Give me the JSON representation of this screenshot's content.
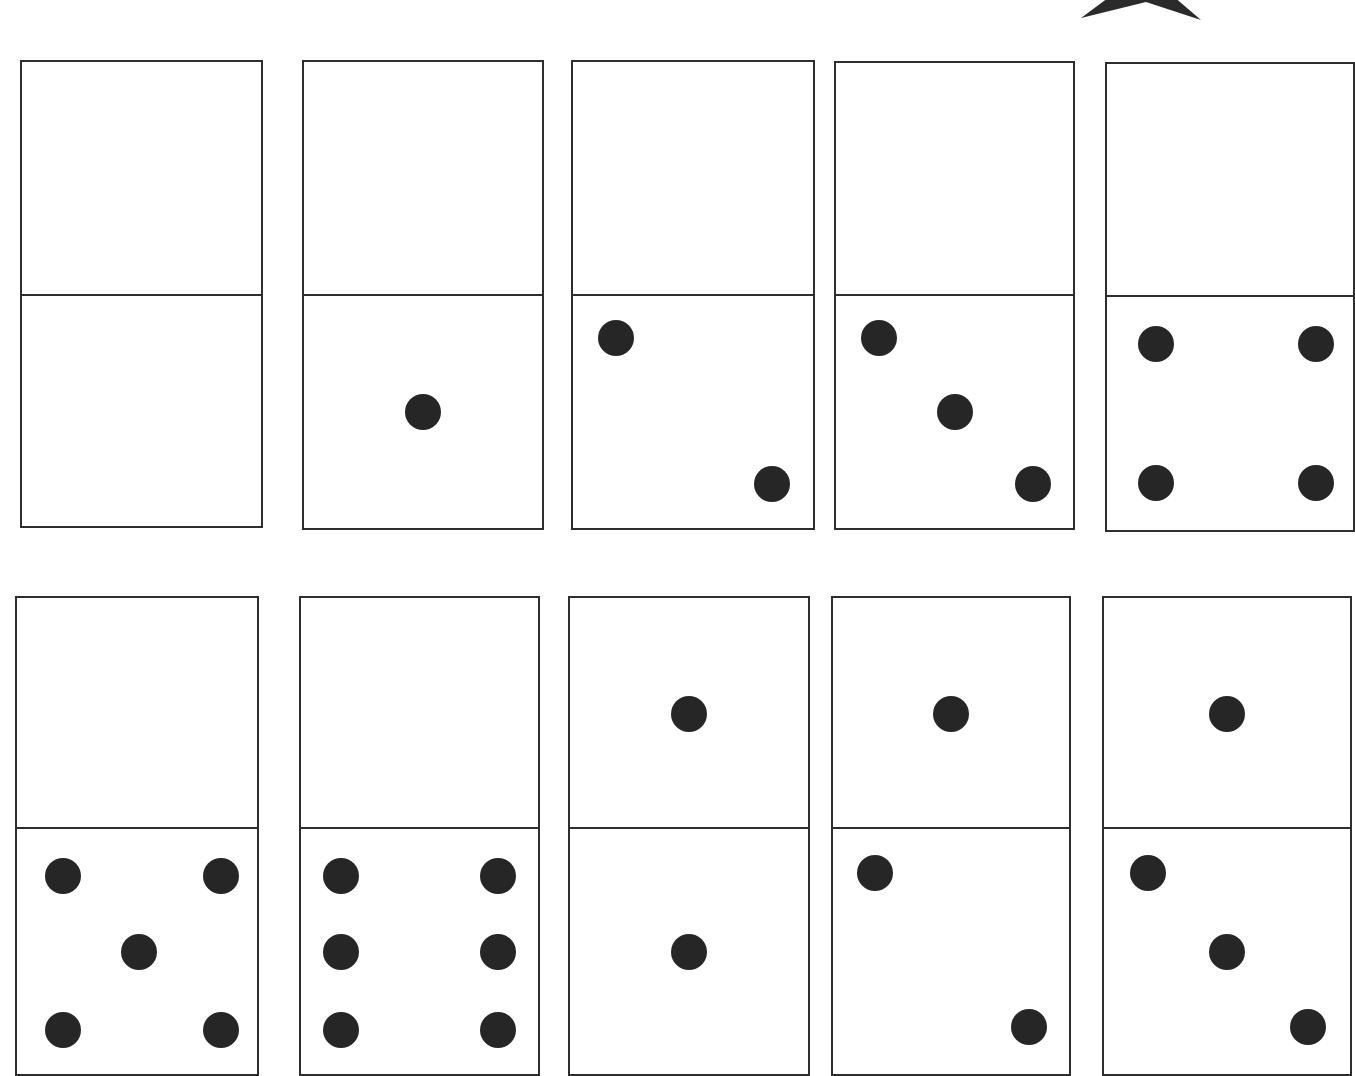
{
  "worksheet": {
    "title": "",
    "decoration": "star-icon",
    "colors": {
      "outline": "#2e2e2e",
      "pip": "#262626",
      "background": "#ffffff"
    },
    "rows": [
      {
        "dominoes": [
          {
            "top": 0,
            "bottom": 0,
            "x": 20,
            "y": 60,
            "w": 243,
            "h": 468,
            "split": 236
          },
          {
            "top": 0,
            "bottom": 1,
            "x": 302,
            "y": 60,
            "w": 242,
            "h": 470,
            "split": 236
          },
          {
            "top": 0,
            "bottom": 2,
            "x": 571,
            "y": 60,
            "w": 244,
            "h": 470,
            "split": 236
          },
          {
            "top": 0,
            "bottom": 3,
            "x": 834,
            "y": 61,
            "w": 241,
            "h": 469,
            "split": 235
          },
          {
            "top": 0,
            "bottom": 4,
            "x": 1105,
            "y": 62,
            "w": 250,
            "h": 470,
            "split": 235
          }
        ]
      },
      {
        "dominoes": [
          {
            "top": 0,
            "bottom": 5,
            "x": 15,
            "y": 596,
            "w": 244,
            "h": 480,
            "split": 233
          },
          {
            "top": 0,
            "bottom": 6,
            "x": 299,
            "y": 596,
            "w": 241,
            "h": 480,
            "split": 233
          },
          {
            "top": 1,
            "bottom": 1,
            "x": 568,
            "y": 596,
            "w": 242,
            "h": 480,
            "split": 233
          },
          {
            "top": 1,
            "bottom": 2,
            "x": 831,
            "y": 596,
            "w": 240,
            "h": 480,
            "split": 233
          },
          {
            "top": 1,
            "bottom": 3,
            "x": 1102,
            "y": 596,
            "w": 250,
            "h": 480,
            "split": 233
          }
        ]
      }
    ]
  }
}
